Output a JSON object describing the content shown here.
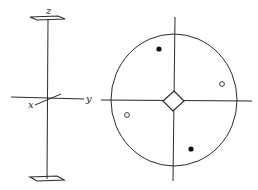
{
  "diagram": {
    "colors": {
      "ink": "#2a2a2a",
      "background": "#ffffff"
    },
    "axis_frame": {
      "labels": {
        "z": "z",
        "x": "x",
        "y": "y"
      },
      "top_plate": "parallelogram",
      "bottom_plate": "parallelogram"
    },
    "stereogram": {
      "primitive_circle": {
        "cx": 174,
        "cy": 100,
        "r": 64
      },
      "center_symbol": "diamond",
      "poles": [
        {
          "type": "filled",
          "x": 159,
          "y": 49
        },
        {
          "type": "open",
          "x": 222,
          "y": 84
        },
        {
          "type": "open",
          "x": 127,
          "y": 115
        },
        {
          "type": "filled",
          "x": 191,
          "y": 149
        }
      ]
    }
  }
}
